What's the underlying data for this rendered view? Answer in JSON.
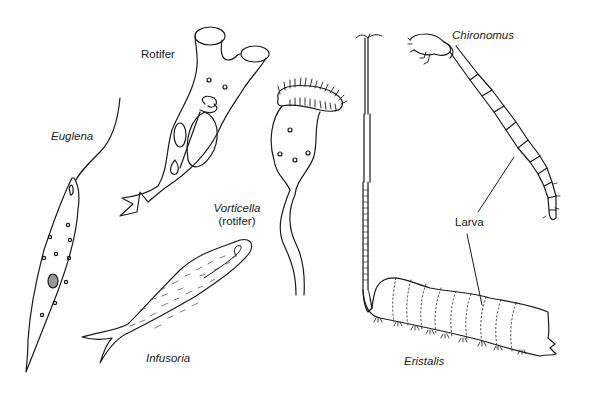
{
  "diagram": {
    "type": "biological line drawing",
    "colors": {
      "ink": "#1a1a1a",
      "background": "#ffffff"
    },
    "organisms": [
      {
        "id": "euglena",
        "label": "Euglena",
        "italic": true
      },
      {
        "id": "rotifer",
        "label": "Rotifer",
        "italic": false
      },
      {
        "id": "vorticella",
        "label": "Vorticella",
        "sublabel": "(rotifer)",
        "italic": true
      },
      {
        "id": "infusoria",
        "label": "Infusoria",
        "italic": true
      },
      {
        "id": "chironomus",
        "label": "Chironomus",
        "italic": true
      },
      {
        "id": "eristalis",
        "label": "Eristalis",
        "italic": true
      }
    ],
    "callout": {
      "label": "Larva",
      "points_to": [
        "chironomus",
        "eristalis"
      ]
    }
  }
}
